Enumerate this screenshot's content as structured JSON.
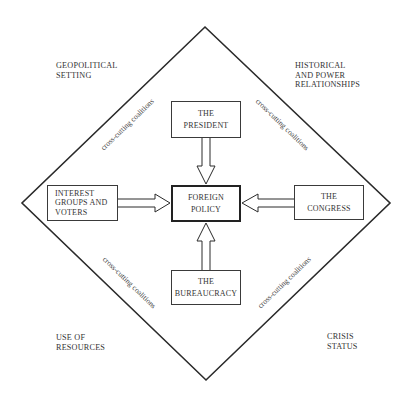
{
  "diagram": {
    "type": "influence diagram",
    "corners": {
      "top_left": [
        "GEOPOLITICAL",
        "SETTING"
      ],
      "top_right": [
        "HISTORICAL",
        "AND POWER",
        "RELATIONSHIPS"
      ],
      "bottom_left": [
        "USE OF",
        "RESOURCES"
      ],
      "bottom_right": [
        "CRISIS",
        "STATUS"
      ]
    },
    "nodes": {
      "president": [
        "THE",
        "PRESIDENT"
      ],
      "foreign_policy": [
        "FOREIGN",
        "POLICY"
      ],
      "interest_groups": [
        "INTEREST",
        "GROUPS AND",
        "VOTERS"
      ],
      "congress": [
        "THE",
        "CONGRESS"
      ],
      "bureaucracy": [
        "THE",
        "BUREAUCRACY"
      ]
    },
    "edges": [
      {
        "from": "president",
        "to": "foreign_policy"
      },
      {
        "from": "interest_groups",
        "to": "foreign_policy"
      },
      {
        "from": "congress",
        "to": "foreign_policy"
      },
      {
        "from": "bureaucracy",
        "to": "foreign_policy"
      }
    ],
    "edge_labels": {
      "top_left": "cross-cutting coalitions",
      "top_right": "cross-cutting coalitions",
      "bottom_left": "cross-cutting coalitions",
      "bottom_right": "cross-cutting coalitions"
    },
    "colors": {
      "line": "#2a2a2a",
      "background": "#ffffff"
    }
  }
}
